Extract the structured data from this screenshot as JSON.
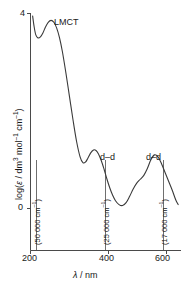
{
  "chart_data": {
    "type": "line",
    "title": "",
    "xlabel": "λ / nm",
    "ylabel": "log(ε / dm³ mol⁻¹ cm⁻¹)",
    "xlim": [
      190,
      615
    ],
    "ylim": [
      -0.35,
      4.15
    ],
    "grid": false,
    "legend": "none",
    "xticks": [
      200,
      400,
      600
    ],
    "xtick_labels": [
      "200",
      "400",
      "600"
    ],
    "yticks": [
      0,
      4
    ],
    "ytick_labels": [
      "0",
      "4"
    ],
    "series": [
      {
        "name": "absorption spectrum",
        "color": "#3a3a3a",
        "x": [
          196,
          200,
          205,
          211,
          218,
          225,
          232,
          240,
          248,
          256,
          264,
          272,
          280,
          290,
          300,
          310,
          320,
          330,
          338,
          345,
          352,
          360,
          368,
          375,
          382,
          390,
          398,
          406,
          414,
          422,
          430,
          440,
          450,
          460,
          470,
          480,
          490,
          500,
          510,
          520,
          530,
          540,
          550,
          560,
          570,
          580,
          590,
          600,
          607
        ],
        "y": [
          3.95,
          3.74,
          3.56,
          3.5,
          3.52,
          3.6,
          3.72,
          3.82,
          3.86,
          3.82,
          3.7,
          3.5,
          3.22,
          2.78,
          2.3,
          1.82,
          1.38,
          1.06,
          0.94,
          0.95,
          1.03,
          1.14,
          1.2,
          1.19,
          1.12,
          0.98,
          0.8,
          0.6,
          0.42,
          0.27,
          0.16,
          0.08,
          0.06,
          0.12,
          0.25,
          0.4,
          0.52,
          0.6,
          0.68,
          0.82,
          1.0,
          1.1,
          1.06,
          0.92,
          0.74,
          0.56,
          0.38,
          0.18,
          0.08
        ]
      }
    ],
    "annotations": [
      {
        "id": "lmct",
        "text": "LMCT",
        "x": 265,
        "y": 3.86,
        "orientation": "horizontal"
      },
      {
        "id": "dd-band-1",
        "text": "d–d",
        "x": 368,
        "y": 1.2,
        "orientation": "horizontal"
      },
      {
        "id": "dd-band-2",
        "text": "d–d",
        "x": 530,
        "y": 1.1,
        "orientation": "horizontal"
      },
      {
        "id": "wavenumber-200nm",
        "text": "(50 000 cm⁻¹)",
        "x": 200,
        "orientation": "vertical"
      },
      {
        "id": "wavenumber-400nm",
        "text": "(25 000 cm⁻¹)",
        "x": 400,
        "orientation": "vertical"
      },
      {
        "id": "wavenumber-588nm",
        "text": "(17 000 cm⁻¹)",
        "x": 588,
        "orientation": "vertical"
      }
    ]
  },
  "axes": {
    "y_label_parts": {
      "prefix": "log(",
      "epsilon": "ε",
      "middle": " / dm",
      "sup3": "3",
      "mol": " mol",
      "sup_m1a": "–1",
      "cm": " cm",
      "sup_m1b": "–1",
      "suffix": ")"
    },
    "x_label_parts": {
      "lambda": "λ",
      "unit": " / nm"
    },
    "y_tick_top": "4",
    "y_tick_bottom": "0",
    "x_tick_left": "200",
    "x_tick_mid": "400",
    "x_tick_right": "600"
  },
  "annotations_text": {
    "lmct": "LMCT",
    "dd_first": "d–d",
    "dd_second": "d–d",
    "wn_50000_open": "(50 000 cm",
    "wn_50000_sup": "–1",
    "wn_50000_close": ")",
    "wn_25000_open": "(25 000 cm",
    "wn_25000_sup": "–1",
    "wn_25000_close": ")",
    "wn_17000_open": "(17 000 cm",
    "wn_17000_sup": "–1",
    "wn_17000_close": ")"
  },
  "colors": {
    "curve": "#3a3a3a",
    "axis": "#4a4a4a",
    "text": "#1a1a1a",
    "background": "#ffffff"
  }
}
